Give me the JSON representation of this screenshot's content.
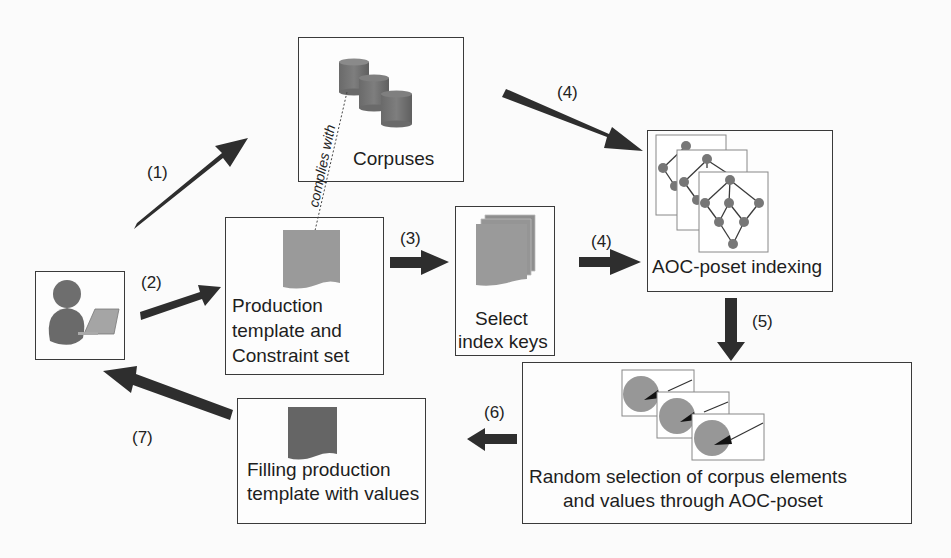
{
  "diagram": {
    "nodes": {
      "user": {
        "icon": "user-with-laptop-icon"
      },
      "corpuses": {
        "label": "Corpuses",
        "icon": "database-stack-icon"
      },
      "production_template": {
        "line1": "Production",
        "line2": "template and",
        "line3": "Constraint set",
        "icon": "document-icon"
      },
      "select_index_keys": {
        "line1": "Select",
        "line2": "index keys",
        "icon": "document-stack-icon"
      },
      "aoc_poset_indexing": {
        "label": "AOC-poset indexing",
        "icon": "lattice-graph-stack-icon"
      },
      "random_selection": {
        "line1": "Random selection of corpus elements",
        "line2": "and values through AOC-poset",
        "icon": "pie-chart-stack-icon"
      },
      "filling_template": {
        "line1": "Filling production",
        "line2": "template with values",
        "icon": "filled-document-icon"
      }
    },
    "edges": [
      {
        "step": "(1)",
        "from": "user",
        "to": "corpuses"
      },
      {
        "step": "(2)",
        "from": "user",
        "to": "production_template"
      },
      {
        "step": "(3)",
        "from": "production_template",
        "to": "select_index_keys"
      },
      {
        "step": "(4)",
        "from": "corpuses",
        "to": "aoc_poset_indexing"
      },
      {
        "step": "(4)",
        "from": "select_index_keys",
        "to": "aoc_poset_indexing"
      },
      {
        "step": "(5)",
        "from": "aoc_poset_indexing",
        "to": "random_selection"
      },
      {
        "step": "(6)",
        "from": "random_selection",
        "to": "filling_template"
      },
      {
        "step": "(7)",
        "from": "filling_template",
        "to": "user"
      }
    ],
    "dotted_link": {
      "label": "complies with",
      "from": "production_template",
      "to": "corpuses"
    },
    "colors": {
      "arrow": "#2e2e2e",
      "shape_gray": "#8c8c8c",
      "dark_gray": "#5e5e5e",
      "border": "#3a3a3a"
    }
  }
}
